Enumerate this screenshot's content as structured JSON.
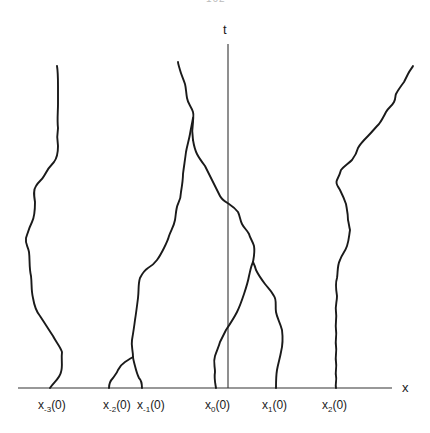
{
  "page_number_fragment": "162",
  "axes": {
    "vertical_label": "t",
    "horizontal_label": "x"
  },
  "colors": {
    "ink": "#1a1a1a",
    "axis": "#333333",
    "background": "#ffffff"
  },
  "initial_points": [
    {
      "base": "x",
      "index": "-3",
      "suffix": "(0)"
    },
    {
      "base": "x",
      "index": "-2",
      "suffix": "(0)"
    },
    {
      "base": "x",
      "index": "-1",
      "suffix": "(0)"
    },
    {
      "base": "x",
      "index": "0",
      "suffix": "(0)"
    },
    {
      "base": "x",
      "index": "1",
      "suffix": "(0)"
    },
    {
      "base": "x",
      "index": "2",
      "suffix": "(0)"
    }
  ]
}
